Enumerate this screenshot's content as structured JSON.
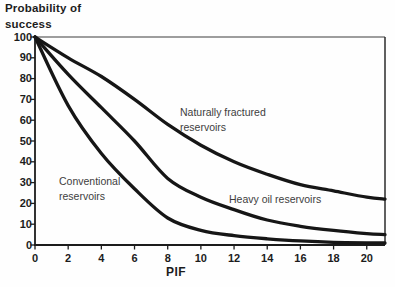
{
  "chart": {
    "title_display": "Probability of\nsuccess",
    "xlabel": "PIF",
    "curve_labels": {
      "naturally_fractured": "Naturally fractured\nreservoirs",
      "conventional": "Conventional\nreservoirs",
      "heavy_oil": "Heavy oil reservoirs"
    }
  },
  "chart_data": {
    "type": "line",
    "xlabel": "PIF",
    "ylabel": "Probability of success",
    "xlim": [
      0,
      21.1
    ],
    "ylim": [
      0,
      100
    ],
    "x_ticks": [
      0,
      2,
      4,
      6,
      8,
      10,
      12,
      14,
      16,
      18,
      20
    ],
    "y_ticks": [
      0,
      10,
      20,
      30,
      40,
      50,
      60,
      70,
      80,
      90,
      100
    ],
    "grid": false,
    "legend_position": "inline-annotations",
    "x": [
      0,
      2,
      4,
      6,
      8,
      10,
      12,
      14,
      16,
      18,
      20,
      21.1
    ],
    "series": [
      {
        "name": "Naturally fractured reservoirs",
        "values": [
          100,
          90,
          81,
          70,
          58,
          48,
          40,
          34,
          29,
          26,
          23,
          22
        ]
      },
      {
        "name": "Heavy oil reservoirs",
        "values": [
          100,
          82,
          66,
          50,
          32,
          23,
          17,
          12,
          9,
          7,
          5.5,
          5
        ]
      },
      {
        "name": "Conventional reservoirs",
        "values": [
          100,
          67,
          44,
          27,
          13,
          7,
          4.5,
          3,
          2,
          1.3,
          1,
          1
        ]
      }
    ],
    "line_color": "#161616",
    "line_width": 3.3,
    "axis_color": "#1c1c1c"
  }
}
